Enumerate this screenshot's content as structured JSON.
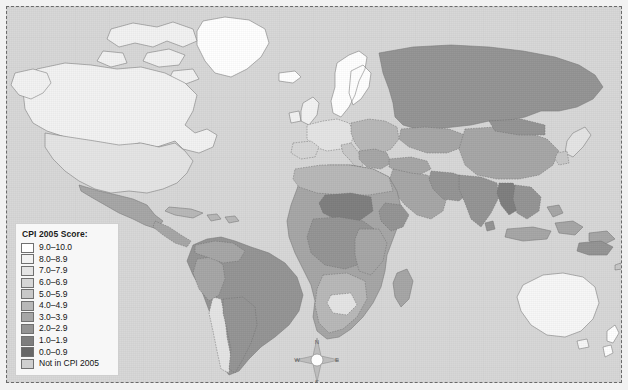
{
  "map": {
    "title": "CPI 2005 Score world map",
    "projection_note": "world choropleth",
    "ocean_color": "#d7d7d7",
    "frame_color": "#6a6a6a"
  },
  "legend": {
    "title": "CPI 2005 Score:",
    "items": [
      {
        "label": "9.0–10.0",
        "color": "#ffffff"
      },
      {
        "label": "8.0–8.9",
        "color": "#f2f2f2"
      },
      {
        "label": "7.0–7.9",
        "color": "#e4e4e4"
      },
      {
        "label": "6.0–6.9",
        "color": "#d6d6d6"
      },
      {
        "label": "5.0–5.9",
        "color": "#c8c8c8"
      },
      {
        "label": "4.0–4.9",
        "color": "#b8b8b8"
      },
      {
        "label": "3.0–3.9",
        "color": "#a6a6a6"
      },
      {
        "label": "2.0–2.9",
        "color": "#949494"
      },
      {
        "label": "1.0–1.9",
        "color": "#7e7e7e"
      },
      {
        "label": "0.0–0.9",
        "color": "#676767"
      },
      {
        "label": "Not in CPI 2005",
        "color": "#cfcfcf"
      }
    ]
  },
  "compass": {
    "north": "N",
    "south": "S",
    "east": "E",
    "west": "W"
  },
  "chart_data": {
    "type": "map",
    "title": "CPI 2005 Score",
    "legend_position": "bottom-left",
    "value_bins": [
      "9.0-10.0",
      "8.0-8.9",
      "7.0-7.9",
      "6.0-6.9",
      "5.0-5.9",
      "4.0-4.9",
      "3.0-3.9",
      "2.0-2.9",
      "1.0-1.9",
      "0.0-0.9",
      "Not in CPI 2005"
    ],
    "regions": [
      {
        "name": "Canada",
        "bin": "8.0-8.9"
      },
      {
        "name": "Greenland",
        "bin": "9.0-10.0"
      },
      {
        "name": "United States",
        "bin": "7.0-7.9"
      },
      {
        "name": "Mexico",
        "bin": "3.0-3.9"
      },
      {
        "name": "Brazil",
        "bin": "3.0-3.9"
      },
      {
        "name": "Chile",
        "bin": "7.0-7.9"
      },
      {
        "name": "Argentina",
        "bin": "2.0-2.9"
      },
      {
        "name": "Nordic countries",
        "bin": "9.0-10.0"
      },
      {
        "name": "United Kingdom",
        "bin": "8.0-8.9"
      },
      {
        "name": "Germany",
        "bin": "8.0-8.9"
      },
      {
        "name": "France",
        "bin": "7.0-7.9"
      },
      {
        "name": "Russia",
        "bin": "2.0-2.9"
      },
      {
        "name": "China",
        "bin": "3.0-3.9"
      },
      {
        "name": "India",
        "bin": "2.0-2.9"
      },
      {
        "name": "Japan",
        "bin": "7.0-7.9"
      },
      {
        "name": "Australia",
        "bin": "8.0-8.9"
      },
      {
        "name": "New Zealand",
        "bin": "9.0-10.0"
      },
      {
        "name": "Chad",
        "bin": "1.0-1.9"
      },
      {
        "name": "Nigeria",
        "bin": "1.0-1.9"
      },
      {
        "name": "Botswana",
        "bin": "5.0-5.9"
      },
      {
        "name": "South Africa",
        "bin": "4.0-4.9"
      },
      {
        "name": "Myanmar",
        "bin": "1.0-1.9"
      },
      {
        "name": "Saudi Arabia",
        "bin": "3.0-3.9"
      }
    ]
  }
}
